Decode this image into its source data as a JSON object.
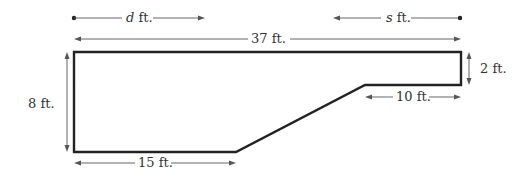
{
  "diagram": {
    "type": "floor-plan-dimensions",
    "colors": {
      "outline": "#222222",
      "dimension_lines": "#555555",
      "text": "#333333",
      "background": "#ffffff"
    },
    "shape": {
      "description": "Polygon: rectangle with a sloped cut on the lower-right",
      "vertices": [
        [
          74,
          52
        ],
        [
          461,
          52
        ],
        [
          461,
          85
        ],
        [
          365,
          85
        ],
        [
          236,
          152
        ],
        [
          74,
          152
        ]
      ]
    },
    "labels": {
      "d_var": "d",
      "d_unit": " ft.",
      "s_var": "s",
      "s_unit": " ft.",
      "top_width": "37 ft.",
      "left_height": "8 ft.",
      "right_height": "2 ft.",
      "step_width": "10 ft.",
      "bottom_width": "15 ft."
    },
    "dimensions": [
      {
        "name": "d",
        "value": "d ft.",
        "direction": "left-to-right from dot"
      },
      {
        "name": "s",
        "value": "s ft.",
        "direction": "right-to-left from dot"
      },
      {
        "name": "top",
        "value": "37 ft."
      },
      {
        "name": "left",
        "value": "8 ft."
      },
      {
        "name": "right",
        "value": "2 ft."
      },
      {
        "name": "step",
        "value": "10 ft."
      },
      {
        "name": "bottom",
        "value": "15 ft."
      }
    ]
  }
}
